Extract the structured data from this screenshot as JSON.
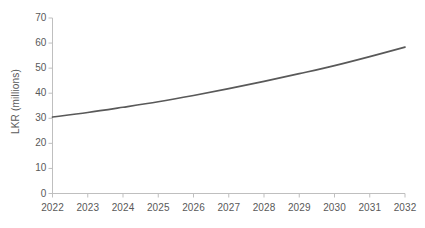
{
  "chart_data": {
    "type": "line",
    "title": "",
    "subtitle": "",
    "xlabel": "",
    "ylabel": "LKR (millions)",
    "x": [
      2022,
      2023,
      2024,
      2025,
      2026,
      2027,
      2028,
      2029,
      2030,
      2031,
      2032
    ],
    "categories": [
      "2022",
      "2023",
      "2024",
      "2025",
      "2026",
      "2027",
      "2028",
      "2029",
      "2030",
      "2031",
      "2032"
    ],
    "values": [
      30.5,
      32.3,
      34.4,
      36.6,
      39.1,
      41.8,
      44.7,
      47.8,
      51.0,
      54.6,
      58.4
    ],
    "series": [
      {
        "name": "LKR (millions)",
        "color": "#595959",
        "values": [
          30.5,
          32.3,
          34.4,
          36.6,
          39.1,
          41.8,
          44.7,
          47.8,
          51.0,
          54.6,
          58.4
        ]
      }
    ],
    "ylim": [
      0,
      70
    ],
    "yticks": [
      0,
      10,
      20,
      30,
      40,
      50,
      60,
      70
    ],
    "ytick_labels": [
      "0",
      "10",
      "20",
      "30",
      "40",
      "50",
      "60",
      "70"
    ],
    "xlim": [
      2022,
      2032
    ],
    "xtick_labels": [
      "2022",
      "2023",
      "2024",
      "2025",
      "2026",
      "2027",
      "2028",
      "2029",
      "2030",
      "2031",
      "2032"
    ],
    "grid": false,
    "legend": false,
    "legend_position": "none",
    "line_color": "#595959",
    "axis_color": "#bfbfbf",
    "background_color": "#ffffff",
    "annotations": []
  }
}
